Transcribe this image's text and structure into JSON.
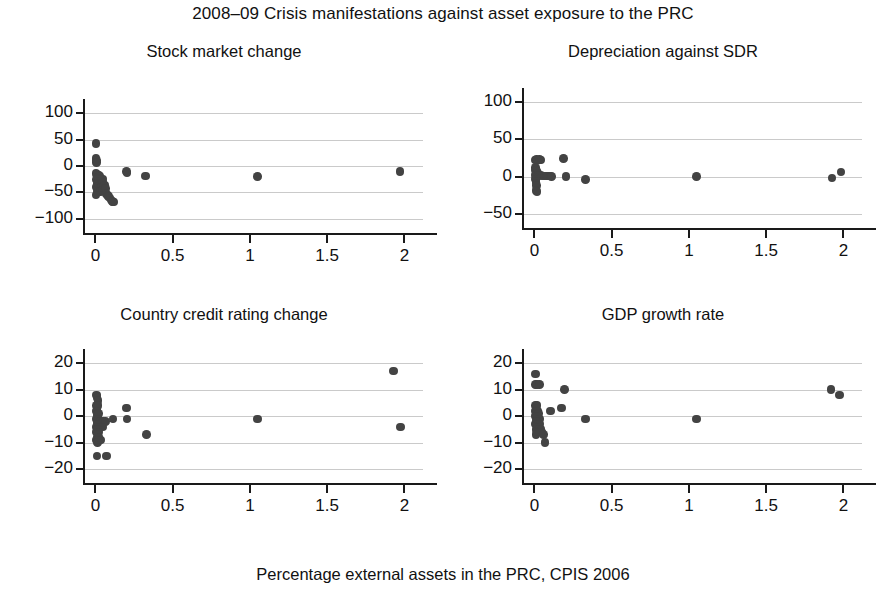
{
  "figure": {
    "title": "2008–09 Crisis manifestations against asset exposure to the PRC",
    "x_caption": "Percentage external assets in the PRC, CPIS 2006",
    "dot_color": "#434343",
    "grid_color": "#cacaca",
    "axis_color": "#1a1a1a"
  },
  "chart_data": [
    {
      "type": "scatter",
      "title": "Stock market change",
      "xlabel": "Percentage external assets in the PRC, CPIS 2006",
      "ylabel": "",
      "xlim": [
        -0.08,
        2.12
      ],
      "ylim": [
        -125,
        125
      ],
      "xticks": [
        0,
        0.5,
        1,
        1.5,
        2
      ],
      "xtick_labels": [
        "0",
        "0.5",
        "1",
        "1.5",
        "2"
      ],
      "yticks": [
        -100,
        -50,
        0,
        50,
        100
      ],
      "ytick_labels": [
        "−100",
        "−50",
        "0",
        "50",
        "100"
      ],
      "grid": "horizontal",
      "legend": "none",
      "points": [
        [
          0.005,
          43
        ],
        [
          0.005,
          14
        ],
        [
          0.006,
          10
        ],
        [
          0.006,
          7
        ],
        [
          0.004,
          -14
        ],
        [
          0.01,
          -16
        ],
        [
          0.016,
          -18
        ],
        [
          0.022,
          -17
        ],
        [
          0.012,
          -21
        ],
        [
          0.02,
          -22
        ],
        [
          0.03,
          -20
        ],
        [
          0.034,
          -24
        ],
        [
          0.008,
          -26
        ],
        [
          0.018,
          -28
        ],
        [
          0.026,
          -30
        ],
        [
          0.038,
          -27
        ],
        [
          0.046,
          -25
        ],
        [
          0.014,
          -33
        ],
        [
          0.024,
          -35
        ],
        [
          0.032,
          -37
        ],
        [
          0.042,
          -34
        ],
        [
          0.05,
          -31
        ],
        [
          0.006,
          -40
        ],
        [
          0.016,
          -42
        ],
        [
          0.028,
          -44
        ],
        [
          0.04,
          -41
        ],
        [
          0.052,
          -39
        ],
        [
          0.06,
          -36
        ],
        [
          0.01,
          -47
        ],
        [
          0.022,
          -49
        ],
        [
          0.034,
          -48
        ],
        [
          0.046,
          -46
        ],
        [
          0.058,
          -45
        ],
        [
          0.066,
          -43
        ],
        [
          0.005,
          -55
        ],
        [
          0.07,
          -52
        ],
        [
          0.078,
          -55
        ],
        [
          0.086,
          -58
        ],
        [
          0.094,
          -61
        ],
        [
          0.102,
          -64
        ],
        [
          0.11,
          -67
        ],
        [
          0.118,
          -68
        ],
        [
          0.2,
          -10
        ],
        [
          0.205,
          -13
        ],
        [
          0.325,
          -19
        ],
        [
          1.05,
          -20
        ],
        [
          1.97,
          -10
        ]
      ]
    },
    {
      "type": "scatter",
      "title": "Depreciation against SDR",
      "xlabel": "Percentage external assets in the PRC, CPIS 2006",
      "ylabel": "",
      "xlim": [
        -0.08,
        2.12
      ],
      "ylim": [
        -68,
        118
      ],
      "xticks": [
        0,
        0.5,
        1,
        1.5,
        2
      ],
      "xtick_labels": [
        "0",
        "0.5",
        "1",
        "1.5",
        "2"
      ],
      "yticks": [
        -50,
        0,
        50,
        100
      ],
      "ytick_labels": [
        "−50",
        "0",
        "50",
        "100"
      ],
      "grid": "horizontal",
      "legend": "none",
      "points": [
        [
          0.005,
          22
        ],
        [
          0.014,
          23
        ],
        [
          0.024,
          22
        ],
        [
          0.034,
          23
        ],
        [
          0.044,
          22
        ],
        [
          0.006,
          12
        ],
        [
          0.008,
          9
        ],
        [
          0.01,
          6
        ],
        [
          0.012,
          4
        ],
        [
          0.016,
          7
        ],
        [
          0.02,
          5
        ],
        [
          0.006,
          2
        ],
        [
          0.014,
          1
        ],
        [
          0.022,
          2
        ],
        [
          0.03,
          1
        ],
        [
          0.04,
          2
        ],
        [
          0.05,
          1
        ],
        [
          0.062,
          1
        ],
        [
          0.074,
          1
        ],
        [
          0.086,
          1
        ],
        [
          0.1,
          1
        ],
        [
          0.112,
          0
        ],
        [
          0.008,
          -3
        ],
        [
          0.012,
          -6
        ],
        [
          0.01,
          -9
        ],
        [
          0.014,
          -12
        ],
        [
          0.012,
          -19
        ],
        [
          0.018,
          -20
        ],
        [
          0.19,
          24
        ],
        [
          0.205,
          0
        ],
        [
          0.33,
          -4
        ],
        [
          1.05,
          0
        ],
        [
          1.925,
          -2
        ],
        [
          1.985,
          6
        ]
      ]
    },
    {
      "type": "scatter",
      "title": "Country credit rating change",
      "xlabel": "Percentage external assets in the PRC, CPIS 2006",
      "ylabel": "",
      "xlim": [
        -0.08,
        2.12
      ],
      "ylim": [
        -26,
        25
      ],
      "xticks": [
        0,
        0.5,
        1,
        1.5,
        2
      ],
      "xtick_labels": [
        "0",
        "0.5",
        "1",
        "1.5",
        "2"
      ],
      "yticks": [
        -20,
        -10,
        0,
        10,
        20
      ],
      "ytick_labels": [
        "−20",
        "−10",
        "0",
        "10",
        "20"
      ],
      "grid": "horizontal",
      "legend": "none",
      "points": [
        [
          0.006,
          8
        ],
        [
          0.01,
          7
        ],
        [
          0.016,
          6
        ],
        [
          0.008,
          4
        ],
        [
          0.012,
          3
        ],
        [
          0.018,
          4
        ],
        [
          0.006,
          2
        ],
        [
          0.01,
          1
        ],
        [
          0.014,
          0
        ],
        [
          0.02,
          1
        ],
        [
          0.008,
          -1
        ],
        [
          0.012,
          -2
        ],
        [
          0.018,
          -1
        ],
        [
          0.024,
          -2
        ],
        [
          0.032,
          -2
        ],
        [
          0.042,
          -2
        ],
        [
          0.054,
          -2
        ],
        [
          0.066,
          -2
        ],
        [
          0.006,
          -4
        ],
        [
          0.012,
          -3
        ],
        [
          0.018,
          -4
        ],
        [
          0.026,
          -4
        ],
        [
          0.036,
          -4
        ],
        [
          0.048,
          -4
        ],
        [
          0.008,
          -6
        ],
        [
          0.014,
          -5
        ],
        [
          0.02,
          -6
        ],
        [
          0.01,
          -8
        ],
        [
          0.016,
          -7
        ],
        [
          0.022,
          -8
        ],
        [
          0.008,
          -9
        ],
        [
          0.014,
          -10
        ],
        [
          0.026,
          -9
        ],
        [
          0.038,
          -9
        ],
        [
          0.012,
          -15
        ],
        [
          0.072,
          -15
        ],
        [
          0.115,
          -1
        ],
        [
          0.2,
          3
        ],
        [
          0.205,
          -1
        ],
        [
          0.33,
          -7
        ],
        [
          1.05,
          -1
        ],
        [
          1.93,
          17
        ],
        [
          1.975,
          -4
        ]
      ]
    },
    {
      "type": "scatter",
      "title": "GDP growth rate",
      "xlabel": "Percentage external assets in the PRC, CPIS 2006",
      "ylabel": "",
      "xlim": [
        -0.08,
        2.12
      ],
      "ylim": [
        -26,
        25
      ],
      "xticks": [
        0,
        0.5,
        1,
        1.5,
        2
      ],
      "xtick_labels": [
        "0",
        "0.5",
        "1",
        "1.5",
        "2"
      ],
      "yticks": [
        -20,
        -10,
        0,
        10,
        20
      ],
      "ytick_labels": [
        "−20",
        "−10",
        "0",
        "10",
        "20"
      ],
      "grid": "horizontal",
      "legend": "none",
      "points": [
        [
          0.008,
          16
        ],
        [
          0.006,
          12
        ],
        [
          0.016,
          12
        ],
        [
          0.034,
          12
        ],
        [
          0.006,
          4
        ],
        [
          0.012,
          3
        ],
        [
          0.018,
          4
        ],
        [
          0.008,
          2
        ],
        [
          0.014,
          1
        ],
        [
          0.02,
          2
        ],
        [
          0.026,
          1
        ],
        [
          0.006,
          0
        ],
        [
          0.012,
          -1
        ],
        [
          0.018,
          0
        ],
        [
          0.024,
          -1
        ],
        [
          0.032,
          -1
        ],
        [
          0.008,
          -3
        ],
        [
          0.014,
          -2
        ],
        [
          0.02,
          -3
        ],
        [
          0.028,
          -3
        ],
        [
          0.038,
          -3
        ],
        [
          0.01,
          -5
        ],
        [
          0.016,
          -4
        ],
        [
          0.022,
          -5
        ],
        [
          0.03,
          -5
        ],
        [
          0.042,
          -5
        ],
        [
          0.012,
          -7
        ],
        [
          0.02,
          -6
        ],
        [
          0.034,
          -6
        ],
        [
          0.05,
          -6
        ],
        [
          0.06,
          -7
        ],
        [
          0.07,
          -10
        ],
        [
          0.105,
          2
        ],
        [
          0.175,
          3
        ],
        [
          0.195,
          10
        ],
        [
          0.33,
          -1
        ],
        [
          1.05,
          -1
        ],
        [
          1.92,
          10
        ],
        [
          1.975,
          8
        ]
      ]
    }
  ]
}
